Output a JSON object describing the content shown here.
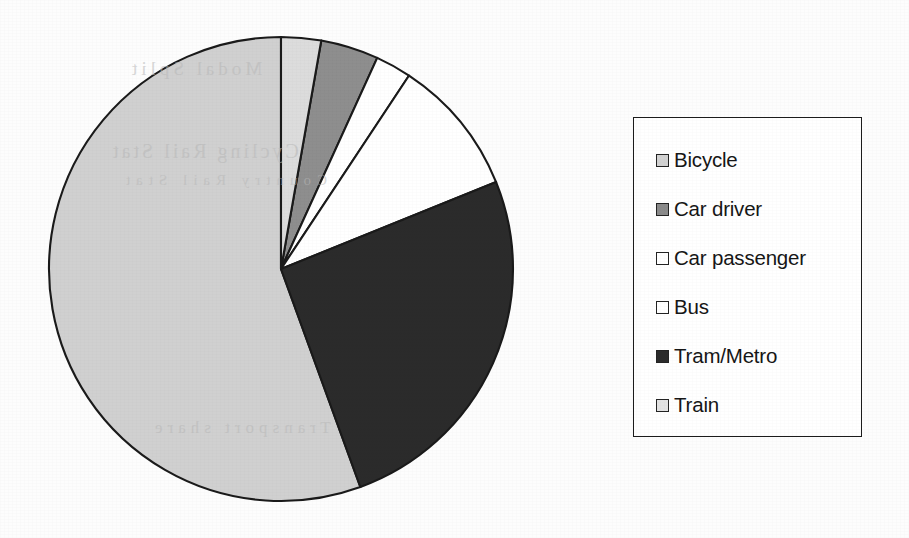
{
  "chart_data": {
    "type": "pie",
    "title": "",
    "subtitle": "",
    "xlabel": "",
    "ylabel": "",
    "grid": false,
    "legend_position": "right",
    "start_angle_deg": 0,
    "direction": "clockwise",
    "categories": [
      "Bicycle",
      "Car driver",
      "Car passenger",
      "Bus",
      "Tram/Metro",
      "Train"
    ],
    "values": [
      55.5,
      4.0,
      2.5,
      9.5,
      25.5,
      3.0
    ],
    "unit": "%",
    "slices": [
      {
        "label": "Bicycle",
        "value": 55.5,
        "start_deg": 160.0,
        "end_deg": 360.0,
        "color": "#d0d0d0"
      },
      {
        "label": "Car driver",
        "value": 4.0,
        "start_deg": 10.0,
        "end_deg": 24.5,
        "color": "#8e8e8e"
      },
      {
        "label": "Car passenger",
        "value": 2.5,
        "start_deg": 24.5,
        "end_deg": 33.5,
        "color": "#ffffff"
      },
      {
        "label": "Bus",
        "value": 9.5,
        "start_deg": 33.5,
        "end_deg": 68.0,
        "color": "#ffffff"
      },
      {
        "label": "Tram/Metro",
        "value": 25.5,
        "start_deg": 68.0,
        "end_deg": 160.0,
        "color": "#2b2b2b"
      },
      {
        "label": "Train",
        "value": 3.0,
        "start_deg": 0.0,
        "end_deg": 10.0,
        "color": "#dcdcdc"
      }
    ],
    "geometry": {
      "center_x": 281,
      "center_y": 269,
      "radius": 232,
      "stroke_color": "#1a1a1a",
      "stroke_width": 2.1
    }
  },
  "legend": {
    "name": "chart-legend",
    "border_color": "#1c1c1c",
    "items": [
      {
        "label": "Bicycle",
        "swatch_color": "#d2d2d2",
        "swatch_border": "#232323"
      },
      {
        "label": "Car driver",
        "swatch_color": "#8a8a8a",
        "swatch_border": "#232323"
      },
      {
        "label": "Car passenger",
        "swatch_color": "#ffffff",
        "swatch_border": "#232323"
      },
      {
        "label": "Bus",
        "swatch_color": "#ffffff",
        "swatch_border": "#232323"
      },
      {
        "label": "Tram/Metro",
        "swatch_color": "#2b2b2b",
        "swatch_border": "#232323"
      },
      {
        "label": "Train",
        "swatch_color": "#e2e2e2",
        "swatch_border": "#232323"
      }
    ]
  },
  "background": {
    "page_color": "#fdfdfd",
    "ghost_lines": [
      "Modal Split",
      "Cycling Rail Stat",
      "Country Rail Stat",
      "Transport share"
    ]
  }
}
